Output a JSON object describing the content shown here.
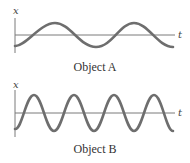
{
  "colors": {
    "axis": "#7a7a7a",
    "wave": "#6e6e6e",
    "text": "#333333"
  },
  "panels": [
    {
      "caption": "Object A",
      "y_axis_label": "x",
      "x_axis_label": "t",
      "periods_shown": 2,
      "description": "Sinusoid of lower frequency (period ~78px)"
    },
    {
      "caption": "Object B",
      "y_axis_label": "x",
      "x_axis_label": "t",
      "periods_shown": 4,
      "description": "Sinusoid of higher frequency and larger amplitude (period ~40px)"
    }
  ]
}
